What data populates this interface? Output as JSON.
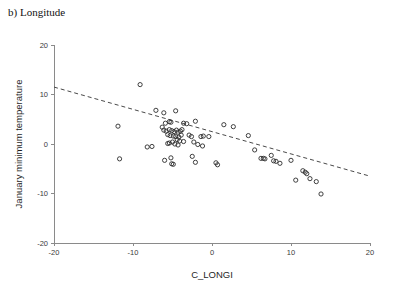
{
  "panel": {
    "label": "b) Longitude"
  },
  "chart_data": {
    "type": "scatter",
    "title": "b) Longitude",
    "xlabel": "C_LONGI",
    "ylabel": "January minimum temperature",
    "xlim": [
      -20,
      20
    ],
    "ylim": [
      -20,
      20
    ],
    "xticks": [
      -20,
      -10,
      0,
      10,
      20
    ],
    "xtick_labels": [
      "-20",
      "-10",
      "0",
      "10",
      "20"
    ],
    "yticks": [
      -20,
      -10,
      0,
      10,
      20
    ],
    "ytick_labels": [
      "-20",
      "-10",
      "0",
      "10",
      "20"
    ],
    "grid": false,
    "legend": null,
    "marker": "open-circle",
    "marker_color": "#2b2b2b",
    "trend_line": {
      "style": "dashed",
      "color": "#4a4a4a",
      "x_start": -20,
      "y_start": 11.5,
      "x_end": 20,
      "y_end": -6.5
    },
    "points": [
      [
        -9.1,
        12.0
      ],
      [
        -11.9,
        3.6
      ],
      [
        -7.1,
        6.8
      ],
      [
        -6.1,
        6.3
      ],
      [
        -4.6,
        6.7
      ],
      [
        -5.4,
        4.5
      ],
      [
        -5.2,
        4.4
      ],
      [
        -5.9,
        4.2
      ],
      [
        -3.6,
        4.2
      ],
      [
        -6.3,
        3.4
      ],
      [
        -6.1,
        2.8
      ],
      [
        -5.8,
        2.6
      ],
      [
        -5.4,
        2.9
      ],
      [
        -5.1,
        2.7
      ],
      [
        -4.8,
        2.5
      ],
      [
        -4.5,
        2.8
      ],
      [
        -4.3,
        2.4
      ],
      [
        -4.0,
        2.6
      ],
      [
        -3.8,
        2.9
      ],
      [
        -5.6,
        1.9
      ],
      [
        -5.3,
        1.7
      ],
      [
        -4.9,
        1.6
      ],
      [
        -4.6,
        1.5
      ],
      [
        -4.2,
        1.4
      ],
      [
        -3.9,
        1.8
      ],
      [
        -4.4,
        0.9
      ],
      [
        -4.1,
        0.6
      ],
      [
        -5.0,
        0.4
      ],
      [
        -5.4,
        0.2
      ],
      [
        -5.6,
        0.1
      ],
      [
        -4.7,
        0.0
      ],
      [
        -4.3,
        -0.2
      ],
      [
        -3.6,
        0.5
      ],
      [
        -2.9,
        1.8
      ],
      [
        -2.6,
        1.5
      ],
      [
        -2.3,
        0.4
      ],
      [
        -1.4,
        1.5
      ],
      [
        -1.1,
        1.6
      ],
      [
        -0.4,
        1.5
      ],
      [
        1.5,
        3.9
      ],
      [
        2.7,
        3.5
      ],
      [
        4.6,
        1.7
      ],
      [
        -3.2,
        4.1
      ],
      [
        -2.1,
        4.6
      ],
      [
        -11.7,
        -3.0
      ],
      [
        -6.0,
        -3.3
      ],
      [
        -5.2,
        -2.8
      ],
      [
        -5.1,
        -4.0
      ],
      [
        -4.9,
        -4.1
      ],
      [
        -2.5,
        -2.5
      ],
      [
        -2.1,
        -3.7
      ],
      [
        -1.2,
        -0.4
      ],
      [
        0.5,
        -3.8
      ],
      [
        0.7,
        -4.2
      ],
      [
        5.4,
        -1.2
      ],
      [
        6.2,
        -2.9
      ],
      [
        6.5,
        -2.9
      ],
      [
        6.7,
        -3.0
      ],
      [
        7.5,
        -2.3
      ],
      [
        7.8,
        -3.4
      ],
      [
        8.1,
        -3.5
      ],
      [
        8.6,
        -3.9
      ],
      [
        10.0,
        -3.3
      ],
      [
        11.5,
        -5.4
      ],
      [
        11.8,
        -5.7
      ],
      [
        12.0,
        -6.0
      ],
      [
        10.6,
        -7.3
      ],
      [
        12.4,
        -7.0
      ],
      [
        13.2,
        -7.6
      ],
      [
        13.8,
        -10.1
      ],
      [
        -8.2,
        -0.6
      ],
      [
        -7.6,
        -0.5
      ],
      [
        -1.8,
        -0.1
      ]
    ]
  }
}
